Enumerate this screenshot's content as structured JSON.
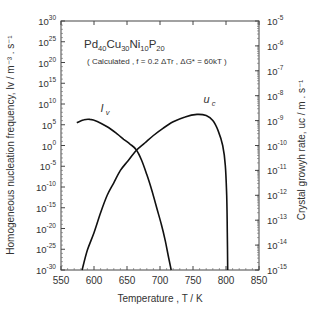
{
  "chart_data": {
    "type": "line",
    "title": "Pd40Cu30Ni10P20",
    "title_parts": [
      {
        "t": "Pd",
        "sub": false
      },
      {
        "t": "40",
        "sub": true
      },
      {
        "t": "Cu",
        "sub": false
      },
      {
        "t": "30",
        "sub": true
      },
      {
        "t": "Ni",
        "sub": false
      },
      {
        "t": "10",
        "sub": true
      },
      {
        "t": "P",
        "sub": false
      },
      {
        "t": "20",
        "sub": true
      }
    ],
    "subtitle": "( Calculated ,  f = 0.2 ΔTr ,  ΔG* = 60kT )",
    "xlabel": "Temperature ,  T  /  K",
    "ylabel_left": "Homogeneous nucleation frequency,  Iv  /  m⁻³ . s⁻¹",
    "ylabel_right": "Crystal growyh rate,  uc  /  m . s⁻¹",
    "xlim": [
      550,
      850
    ],
    "xticks": [
      550,
      600,
      650,
      700,
      750,
      800,
      850
    ],
    "ylim_left_log10": [
      -30,
      30
    ],
    "yticks_left_exp": [
      30,
      25,
      20,
      15,
      10,
      5,
      0,
      -5,
      -10,
      -15,
      -20,
      -25,
      -30
    ],
    "ylim_right_log10": [
      -15,
      -5
    ],
    "yticks_right_exp": [
      -5,
      -6,
      -7,
      -8,
      -9,
      -10,
      -11,
      -12,
      -13,
      -14,
      -15
    ],
    "grid": false,
    "series": [
      {
        "name": "Iv",
        "label": "I",
        "label_sub": "v",
        "axis": "left",
        "x": [
          574,
          585,
          594,
          605,
          620,
          635,
          645,
          655,
          664,
          672,
          680,
          688,
          695,
          702,
          708,
          713,
          717
        ],
        "log10_y": [
          5.5,
          6.2,
          6.3,
          5.8,
          4.5,
          2.8,
          1.5,
          0.3,
          -1.0,
          -3.5,
          -7,
          -11,
          -15,
          -19,
          -23,
          -27,
          -30
        ]
      },
      {
        "name": "uc",
        "label": "u",
        "label_sub": "c",
        "axis": "right",
        "x": [
          582,
          590,
          600,
          610,
          620,
          630,
          640,
          652,
          664,
          677,
          690,
          705,
          720,
          738,
          756,
          770,
          780,
          788,
          795,
          799,
          801,
          802,
          802.5
        ],
        "log10_y": [
          -15,
          -14.2,
          -13.5,
          -12.7,
          -12.0,
          -11.5,
          -11.0,
          -10.6,
          -10.2,
          -9.9,
          -9.6,
          -9.3,
          -9.05,
          -8.85,
          -8.75,
          -8.8,
          -9.0,
          -9.4,
          -10.0,
          -10.8,
          -12.0,
          -13.5,
          -15
        ]
      }
    ],
    "annotations": [
      {
        "text": "Iv",
        "near_x": 610,
        "near_log10_y_left": 8
      },
      {
        "text": "uc",
        "near_x": 766,
        "near_log10_y_right": -8.3
      }
    ]
  }
}
